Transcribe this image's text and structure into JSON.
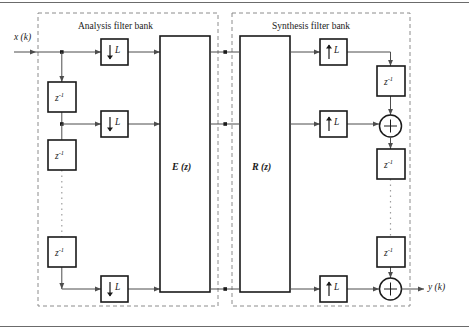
{
  "figure": {
    "type": "block-diagram",
    "background_color": "#ffffff",
    "line_color": "#4d4d4d",
    "block_border_color": "#1a1a1a",
    "dashed_group_color": "#808080"
  },
  "groups": [
    {
      "id": "analysis",
      "label": "Analysis filter bank"
    },
    {
      "id": "synthesis",
      "label": "Synthesis filter bank"
    }
  ],
  "signals": {
    "input_label": "x (k)",
    "output_label": "y (k)"
  },
  "matrix_blocks": [
    {
      "id": "E",
      "label_main": "E",
      "label_arg": "(z)"
    },
    {
      "id": "R",
      "label_main": "R",
      "label_arg": "(z)"
    }
  ],
  "analysis_blocks": {
    "downsamplers": [
      {
        "id": "down-1",
        "label_arrow": "↓",
        "label_factor": "L"
      },
      {
        "id": "down-2",
        "label_arrow": "↓",
        "label_factor": "L"
      },
      {
        "id": "down-3",
        "label_arrow": "↓",
        "label_factor": "L"
      }
    ],
    "delays": [
      {
        "id": "delay-a1",
        "label_base": "z",
        "label_exp": "-1"
      },
      {
        "id": "delay-a2",
        "label_base": "z",
        "label_exp": "-1"
      },
      {
        "id": "delay-a3",
        "label_base": "z",
        "label_exp": "-1"
      }
    ],
    "ellipsis": "vertical-dotted"
  },
  "synthesis_blocks": {
    "upsamplers": [
      {
        "id": "up-1",
        "label_arrow": "↑",
        "label_factor": "L"
      },
      {
        "id": "up-2",
        "label_arrow": "↑",
        "label_factor": "L"
      },
      {
        "id": "up-3",
        "label_arrow": "↑",
        "label_factor": "L"
      }
    ],
    "delays": [
      {
        "id": "delay-s1",
        "label_base": "z",
        "label_exp": "-1"
      },
      {
        "id": "delay-s2",
        "label_base": "z",
        "label_exp": "-1"
      },
      {
        "id": "delay-s3",
        "label_base": "z",
        "label_exp": "-1"
      }
    ],
    "adders": [
      {
        "id": "adder-1",
        "symbol": "+"
      },
      {
        "id": "adder-2",
        "symbol": "+"
      }
    ],
    "ellipsis": "vertical-dotted"
  }
}
